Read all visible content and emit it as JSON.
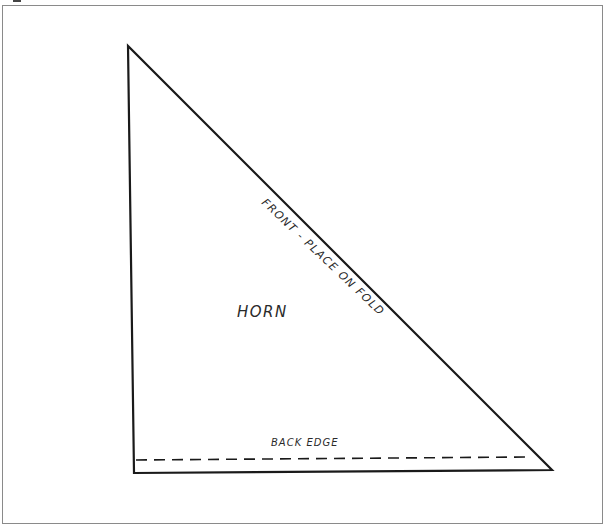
{
  "diagram": {
    "type": "sewing-pattern-piece",
    "piece_name": "HORN",
    "labels": {
      "piece": "HORN",
      "hypotenuse": "FRONT - PLACE ON FOLD",
      "bottom": "BACK EDGE"
    },
    "shape": {
      "kind": "right-triangle",
      "vertices": [
        {
          "name": "top",
          "x": 128,
          "y": 46
        },
        {
          "name": "bottom-left",
          "x": 134,
          "y": 473
        },
        {
          "name": "bottom-right",
          "x": 552,
          "y": 470
        }
      ],
      "stroke_color": "#1a1a1a"
    },
    "dashed_line": {
      "meaning": "back edge seam line",
      "x1": 136,
      "y1": 460,
      "x2": 525,
      "y2": 457
    },
    "frame_color": "#8a8a8a"
  }
}
